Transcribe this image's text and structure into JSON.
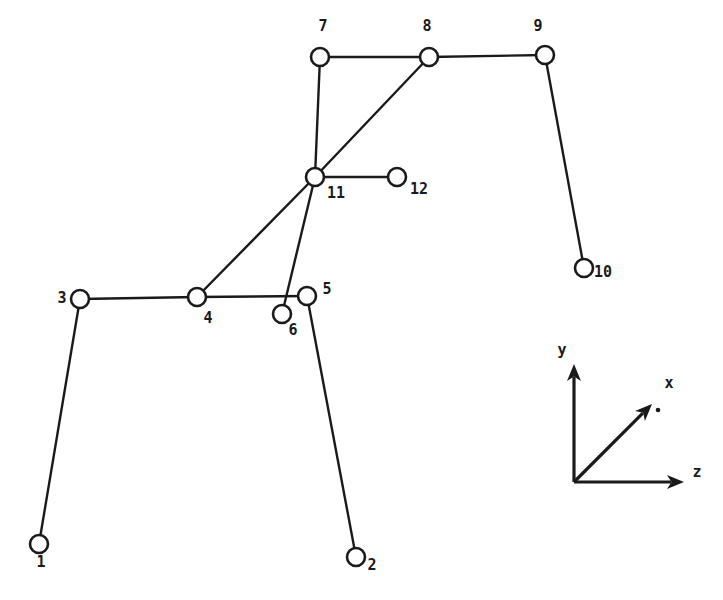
{
  "figure": {
    "kind": "structural-frame-node-diagram",
    "background_color": "#ffffff",
    "ink_color": "#1a1a1a",
    "width": 723,
    "height": 600,
    "node_radius": 9,
    "node_stroke_width": 2.6,
    "member_stroke_width": 2.4
  },
  "nodes": [
    {
      "id": "1",
      "label": "1",
      "x": 39,
      "y": 544,
      "label_x": 41,
      "label_y": 567,
      "label_anchor": "middle"
    },
    {
      "id": "2",
      "label": "2",
      "x": 356,
      "y": 557,
      "label_x": 372,
      "label_y": 570,
      "label_anchor": "middle"
    },
    {
      "id": "3",
      "label": "3",
      "x": 80,
      "y": 299,
      "label_x": 62,
      "label_y": 303,
      "label_anchor": "middle"
    },
    {
      "id": "4",
      "label": "4",
      "x": 197,
      "y": 297,
      "label_x": 208,
      "label_y": 323,
      "label_anchor": "middle"
    },
    {
      "id": "5",
      "label": "5",
      "x": 307,
      "y": 296,
      "label_x": 327,
      "label_y": 294,
      "label_anchor": "middle"
    },
    {
      "id": "6",
      "label": "6",
      "x": 282,
      "y": 314,
      "label_x": 293,
      "label_y": 335,
      "label_anchor": "middle"
    },
    {
      "id": "7",
      "label": "7",
      "x": 320,
      "y": 57,
      "label_x": 323,
      "label_y": 31,
      "label_anchor": "middle"
    },
    {
      "id": "8",
      "label": "8",
      "x": 429,
      "y": 57,
      "label_x": 427,
      "label_y": 31,
      "label_anchor": "middle"
    },
    {
      "id": "9",
      "label": "9",
      "x": 545,
      "y": 55,
      "label_x": 538,
      "label_y": 31,
      "label_anchor": "middle"
    },
    {
      "id": "10",
      "label": "10",
      "x": 584,
      "y": 268,
      "label_x": 603,
      "label_y": 277,
      "label_anchor": "middle"
    },
    {
      "id": "11",
      "label": "11",
      "x": 315,
      "y": 177,
      "label_x": 336,
      "label_y": 198,
      "label_anchor": "middle"
    },
    {
      "id": "12",
      "label": "12",
      "x": 397,
      "y": 177,
      "label_x": 419,
      "label_y": 194,
      "label_anchor": "middle"
    }
  ],
  "members": [
    {
      "name": "member-1-3",
      "from": "1",
      "to": "3"
    },
    {
      "name": "member-3-4",
      "from": "3",
      "to": "4"
    },
    {
      "name": "member-4-5",
      "from": "4",
      "to": "5"
    },
    {
      "name": "member-5-2",
      "from": "5",
      "to": "2"
    },
    {
      "name": "member-4-11",
      "from": "4",
      "to": "11"
    },
    {
      "name": "member-11-8",
      "from": "11",
      "to": "8"
    },
    {
      "name": "member-6-11",
      "from": "6",
      "to": "11"
    },
    {
      "name": "member-11-7",
      "from": "11",
      "to": "7"
    },
    {
      "name": "member-11-12",
      "from": "11",
      "to": "12"
    },
    {
      "name": "member-7-8",
      "from": "7",
      "to": "8"
    },
    {
      "name": "member-8-9",
      "from": "8",
      "to": "9"
    },
    {
      "name": "member-9-10",
      "from": "9",
      "to": "10"
    }
  ],
  "axis_triad": {
    "name": "coordinate-axis-triad",
    "origin": {
      "x": 574,
      "y": 482
    },
    "axes": [
      {
        "id": "y",
        "label": "y",
        "tip_x": 574,
        "tip_y": 364,
        "label_x": 562,
        "label_y": 355
      },
      {
        "id": "z",
        "label": "z",
        "tip_x": 684,
        "tip_y": 482,
        "label_x": 697,
        "label_y": 477
      },
      {
        "id": "x",
        "label": "x",
        "tip_x": 652,
        "tip_y": 404,
        "label_x": 669,
        "label_y": 388
      }
    ],
    "x_axis_dot": {
      "x": 658,
      "y": 410
    }
  }
}
